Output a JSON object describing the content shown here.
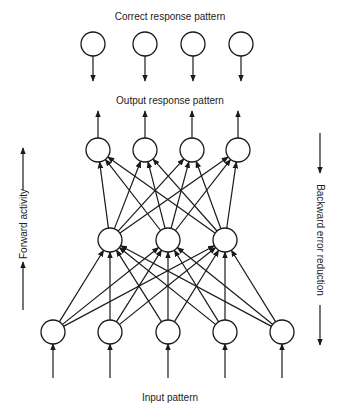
{
  "labels": {
    "correct": "Correct  response pattern",
    "output": "Output response pattern",
    "input": "Input pattern",
    "forward": "Forward activity",
    "backward": "Backward error reduction"
  },
  "colors": {
    "stroke": "#1a1a1a",
    "text": "#222222",
    "background": "#ffffff"
  },
  "layers": {
    "correct": {
      "y": 44,
      "r": 12,
      "x": [
        93,
        145,
        193,
        241
      ]
    },
    "output": {
      "y": 150,
      "r": 12,
      "x": [
        98,
        145,
        192,
        238
      ]
    },
    "hidden": {
      "y": 240,
      "r": 12,
      "x": [
        110,
        168,
        225
      ]
    },
    "input": {
      "y": 332,
      "r": 12,
      "x": [
        53,
        110,
        168,
        225,
        282
      ]
    }
  },
  "connections": "fully connected input->hidden and hidden->output with upward arrows",
  "side_arrows": {
    "forward": {
      "x": 23,
      "segments": [
        [
          190,
          148
        ],
        [
          310,
          262
        ]
      ],
      "direction": "up"
    },
    "backward": {
      "x": 320,
      "segments": [
        [
          133,
          173
        ],
        [
          305,
          345
        ]
      ],
      "direction": "down"
    }
  }
}
